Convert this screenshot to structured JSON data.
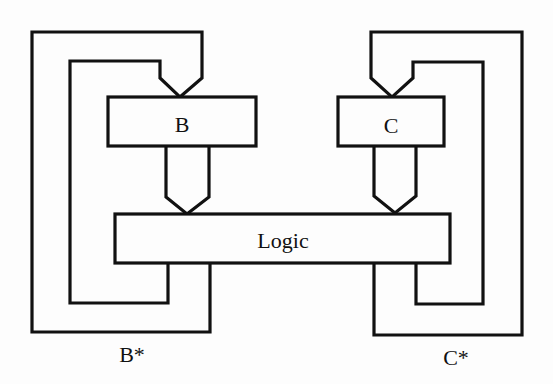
{
  "diagram": {
    "type": "block-diagram",
    "blocks": {
      "b": {
        "label": "B"
      },
      "c": {
        "label": "C"
      },
      "logic": {
        "label": "Logic"
      }
    },
    "outputs": {
      "b_star": {
        "label": "B*"
      },
      "c_star": {
        "label": "C*"
      }
    },
    "colors": {
      "stroke": "#111111",
      "background": "#fdfdfd"
    },
    "connections": [
      {
        "from": "B",
        "to": "Logic",
        "style": "wide-arrow"
      },
      {
        "from": "C",
        "to": "Logic",
        "style": "wide-arrow"
      },
      {
        "from": "Logic",
        "to": "B",
        "style": "feedback-loop",
        "output": "B*"
      },
      {
        "from": "Logic",
        "to": "C",
        "style": "feedback-loop",
        "output": "C*"
      }
    ]
  }
}
